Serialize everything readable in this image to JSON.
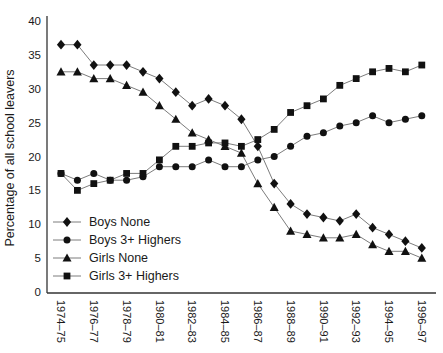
{
  "chart_data": {
    "type": "line",
    "title": "",
    "xlabel": "",
    "ylabel": "Percentage of all school leavers",
    "ylim": [
      0,
      40
    ],
    "yticks": [
      0,
      5,
      10,
      15,
      20,
      25,
      30,
      35,
      40
    ],
    "grid": false,
    "legend_position": "inside-bottom-left",
    "x_categories": [
      "1974–75",
      "1975–76",
      "1976–77",
      "1977–78",
      "1978–79",
      "1979–80",
      "1980–81",
      "1981–82",
      "1982–83",
      "1983–84",
      "1984–85",
      "1985–86",
      "1986–87",
      "1987–88",
      "1988–89",
      "1989–90",
      "1990–91",
      "1991–92",
      "1992–93",
      "1993–94",
      "1994–95",
      "1995–96",
      "1996–97"
    ],
    "x_tick_labels_shown": [
      "1974–75",
      "1976–77",
      "1978–79",
      "1980–81",
      "1982–83",
      "1984–85",
      "1986–87",
      "1988–89",
      "1990–91",
      "1992–93",
      "1994–95",
      "1996–97"
    ],
    "series": [
      {
        "name": "Boys None",
        "marker": "diamond",
        "values": [
          36.5,
          36.5,
          33.5,
          33.5,
          33.5,
          32.5,
          31.5,
          29.5,
          27.5,
          28.5,
          27.5,
          25.5,
          21.5,
          16,
          13,
          11.5,
          11,
          10.5,
          11.5,
          9.5,
          8.5,
          7.5,
          6.5
        ]
      },
      {
        "name": "Boys 3+ Highers",
        "marker": "circle",
        "values": [
          17.5,
          16.5,
          17.5,
          16.5,
          16.5,
          17,
          18.5,
          18.5,
          18.5,
          19.5,
          18.5,
          18.5,
          19.5,
          20,
          21.5,
          23,
          23.5,
          24.5,
          25,
          26,
          25,
          25.5,
          26
        ]
      },
      {
        "name": "Girls None",
        "marker": "triangle",
        "values": [
          32.5,
          32.5,
          31.5,
          31.5,
          30.5,
          29.5,
          27.5,
          25.5,
          23.5,
          22.5,
          21.5,
          20.5,
          16,
          12.5,
          9,
          8.5,
          8,
          8,
          8.5,
          7,
          6,
          6,
          5
        ]
      },
      {
        "name": "Girls 3+ Highers",
        "marker": "square",
        "values": [
          17.5,
          15,
          16,
          16.5,
          17.5,
          17.5,
          19.5,
          21.5,
          21.5,
          22,
          22,
          21.5,
          22.5,
          24,
          26.5,
          27.5,
          28.5,
          30.5,
          31.5,
          32.5,
          33,
          32.5,
          33.5
        ]
      }
    ],
    "colors": {
      "marker": "#111111",
      "line": "#7c7c7c",
      "axis": "#333333",
      "text": "#1a1a1a"
    }
  }
}
